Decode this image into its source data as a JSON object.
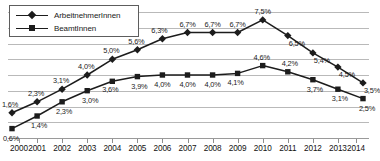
{
  "chart_data": {
    "type": "line",
    "title": "",
    "xlabel": "",
    "ylabel": "",
    "ylim": [
      0,
      8.0
    ],
    "grid": true,
    "legend_position": "top-left",
    "categories": [
      "2000",
      "2001",
      "2002",
      "2003",
      "2004",
      "2005",
      "2006",
      "2007",
      "2008",
      "2009",
      "2010",
      "2011",
      "2012",
      "2013",
      "2014"
    ],
    "series": [
      {
        "name": "ArbeitnehmerInnen",
        "marker": "diamond",
        "color": "#1c1c1c",
        "values": [
          1.6,
          2.3,
          3.1,
          4.0,
          5.0,
          5.6,
          6.3,
          6.7,
          6.7,
          6.7,
          7.5,
          6.5,
          5.4,
          4.5,
          3.5
        ],
        "labels": [
          "1,6%",
          "2,3%",
          "3,1%",
          "4,0%",
          "5,0%",
          "5,6%",
          "6,3%",
          "6,7%",
          "6,7%",
          "6,7%",
          "7,5%",
          "6,5%",
          "5,4%",
          "4,5%",
          "3,5%"
        ]
      },
      {
        "name": "BeamtInnen",
        "marker": "square",
        "color": "#1c1c1c",
        "values": [
          0.6,
          1.4,
          2.3,
          3.0,
          3.6,
          3.9,
          4.0,
          4.0,
          4.0,
          4.1,
          4.6,
          4.2,
          3.7,
          3.1,
          2.5
        ],
        "labels": [
          "0,6%",
          "1,4%",
          "2,3%",
          "3,0%",
          "3,6%",
          "3,9%",
          "4,0%",
          "4,0%",
          "4,0%",
          "4,1%",
          "4,6%",
          "4,2%",
          "3,7%",
          "3,1%",
          "2,5%"
        ]
      }
    ],
    "gridline_values": [
      8.0,
      7.0,
      6.0,
      5.0,
      4.0,
      3.0,
      2.0,
      1.0,
      0.0
    ]
  },
  "legend": {
    "items": [
      {
        "label": "ArbeitnehmerInnen",
        "marker": "diamond"
      },
      {
        "label": "BeamtInnen",
        "marker": "square"
      }
    ]
  }
}
